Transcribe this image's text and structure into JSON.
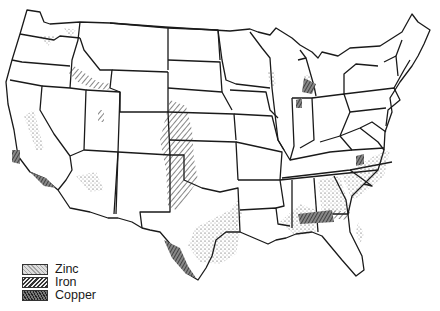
{
  "map": {
    "title": "",
    "subject": "United States mineral deposits",
    "colors": {
      "border": "#1a1a1a",
      "background": "#ffffff",
      "zinc": "#555555",
      "iron": "#333333",
      "copper": "#222222"
    }
  },
  "legend": {
    "items": [
      {
        "label": "Zinc",
        "pattern": "stipple"
      },
      {
        "label": "Iron",
        "pattern": "hatch"
      },
      {
        "label": "Copper",
        "pattern": "dense-crosshatch"
      }
    ]
  },
  "deposits": {
    "zinc": [
      "Washington",
      "Idaho",
      "Utah",
      "Arizona",
      "California",
      "Texas",
      "Oklahoma",
      "Arkansas",
      "Louisiana",
      "Mississippi",
      "Alabama",
      "Georgia",
      "South Carolina",
      "North Carolina",
      "Florida",
      "Wisconsin",
      "Michigan"
    ],
    "iron": [
      "Montana-Idaho border",
      "Colorado",
      "New Mexico",
      "Wyoming",
      "Texas",
      "Oklahoma",
      "Kansas",
      "Nebraska",
      "Florida panhandle"
    ],
    "copper": [
      "California coast",
      "Texas south",
      "Michigan",
      "Indiana",
      "North Carolina",
      "Florida panhandle"
    ]
  }
}
